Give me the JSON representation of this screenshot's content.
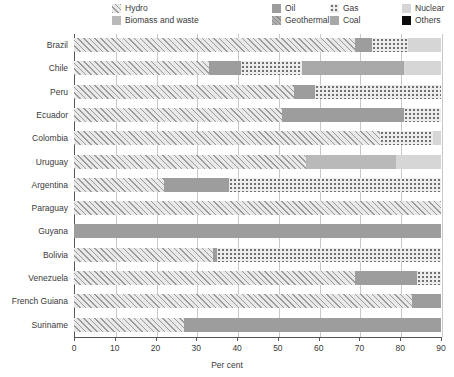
{
  "chart_data": {
    "type": "bar",
    "orientation": "horizontal",
    "stacked": true,
    "title": "",
    "xlabel": "Per cent",
    "ylabel": "",
    "xlim": [
      0,
      90
    ],
    "xticks": [
      0,
      10,
      20,
      30,
      40,
      50,
      60,
      70,
      80,
      90
    ],
    "xtick_labels": [
      "0",
      "10",
      "20",
      "30",
      "40",
      "50",
      "60",
      "70",
      "80",
      "90"
    ],
    "grid": true,
    "legend_position": "top",
    "categories": [
      "Brazil",
      "Chile",
      "Peru",
      "Ecuador",
      "Colombia",
      "Uruguay",
      "Argentina",
      "Paraguay",
      "Guyana",
      "Bolivia",
      "Venezuela",
      "French Guiana",
      "Suriname"
    ],
    "series": [
      {
        "name": "Hydro",
        "key": "hydro",
        "pattern": "p-hydro",
        "color": "#e9e9e9",
        "values": [
          69,
          33,
          54,
          51,
          75,
          57,
          22,
          90,
          0,
          34,
          69,
          83,
          27
        ]
      },
      {
        "name": "Biomass and waste",
        "key": "biomass",
        "pattern": "p-biomass",
        "color": "#b9b9b9",
        "values": [
          0,
          0,
          0,
          0,
          0,
          22,
          0,
          0,
          0,
          0,
          0,
          0,
          0
        ]
      },
      {
        "name": "Oil",
        "key": "oil",
        "pattern": "p-oil",
        "color": "#9d9d9d",
        "values": [
          4,
          8,
          5,
          30,
          0,
          0,
          16,
          0,
          90,
          1,
          15,
          7,
          63
        ]
      },
      {
        "name": "Geothermal",
        "key": "geothermal",
        "pattern": "p-geothermal",
        "color": "#b0b0b0",
        "values": [
          0,
          0,
          0,
          0,
          0,
          0,
          0,
          0,
          0,
          0,
          0,
          0,
          0
        ]
      },
      {
        "name": "Gas",
        "key": "gas",
        "pattern": "p-gas",
        "color": "#ededed",
        "values": [
          9,
          15,
          31,
          9,
          13,
          0,
          52,
          0,
          0,
          55,
          6,
          0,
          0
        ]
      },
      {
        "name": "Coal",
        "key": "coal",
        "pattern": "p-coal",
        "color": "#a8a8a8",
        "values": [
          0,
          25,
          0,
          0,
          0,
          0,
          0,
          0,
          0,
          0,
          0,
          0,
          0
        ]
      },
      {
        "name": "Nuclear",
        "key": "nuclear",
        "pattern": "p-nuclear",
        "color": "#d6d6d6",
        "values": [
          8,
          9,
          0,
          0,
          2,
          11,
          0,
          0,
          0,
          0,
          0,
          0,
          0
        ]
      },
      {
        "name": "Others",
        "key": "others",
        "pattern": "p-others",
        "color": "#0b0b0b",
        "values": [
          0,
          0,
          0,
          0,
          0,
          0,
          0,
          0,
          0,
          0,
          0,
          0,
          0
        ]
      }
    ]
  },
  "legend": {
    "items": [
      {
        "label": "Hydro",
        "pattern": "p-hydro"
      },
      {
        "label": "Biomass and waste",
        "pattern": "p-biomass"
      },
      {
        "label": "Oil",
        "pattern": "p-oil"
      },
      {
        "label": "Geothermal",
        "pattern": "p-geothermal"
      },
      {
        "label": "Gas",
        "pattern": "p-gas"
      },
      {
        "label": "Nuclear",
        "pattern": "p-nuclear"
      },
      {
        "label": "Coal",
        "pattern": "p-coal"
      },
      {
        "label": "Others",
        "pattern": "p-others"
      }
    ],
    "layout": [
      {
        "label": "Hydro",
        "col": 0,
        "row": 0
      },
      {
        "label": "Biomass and waste",
        "col": 0,
        "row": 1
      },
      {
        "label": "Oil",
        "col": 1,
        "row": 0
      },
      {
        "label": "Geothermal",
        "col": 1,
        "row": 1
      },
      {
        "label": "Gas",
        "col": 2,
        "row": 0
      },
      {
        "label": "Coal",
        "col": 2,
        "row": 1
      },
      {
        "label": "Nuclear",
        "col": 3,
        "row": 0
      },
      {
        "label": "Others",
        "col": 3,
        "row": 1
      }
    ]
  },
  "axis": {
    "x_title": "Per cent"
  }
}
